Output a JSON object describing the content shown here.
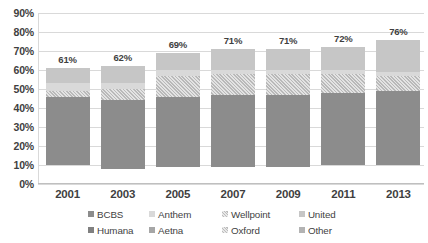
{
  "chart_data": {
    "type": "bar",
    "title": "",
    "xlabel": "",
    "ylabel": "",
    "stacked": true,
    "grid": true,
    "legend_position": "bottom",
    "ylim": [
      0,
      90
    ],
    "ytick_labels": [
      "90%",
      "80%",
      "70%",
      "60%",
      "50%",
      "40%",
      "30%",
      "20%",
      "10%",
      "0%"
    ],
    "ytick_values": [
      90,
      80,
      70,
      60,
      50,
      40,
      30,
      20,
      10,
      0
    ],
    "categories": [
      "2001",
      "2003",
      "2005",
      "2007",
      "2009",
      "2011",
      "2013"
    ],
    "totals": [
      61,
      62,
      69,
      71,
      71,
      72,
      76
    ],
    "total_labels": [
      "61%",
      "62%",
      "69%",
      "71%",
      "71%",
      "72%",
      "76%"
    ],
    "series": [
      {
        "name": "BCBS",
        "color": "#8c8c8c",
        "pattern": "solid",
        "values": [
          36,
          36,
          37,
          38,
          38,
          38,
          39
        ]
      },
      {
        "name": "Anthem",
        "color": "#d9d9d9",
        "pattern": "solid",
        "values": [
          4,
          3,
          3,
          2,
          2,
          2,
          2
        ]
      },
      {
        "name": "Wellpoint",
        "color": "#dcdcdc",
        "pattern": "diagonal-hatch",
        "values": [
          3,
          6,
          11,
          11,
          11,
          10,
          8
        ]
      },
      {
        "name": "United",
        "color": "#c6c6c6",
        "pattern": "solid",
        "values": [
          8,
          9,
          9,
          11,
          11,
          12,
          17
        ]
      },
      {
        "name": "Humana",
        "color": "#808080",
        "pattern": "solid",
        "values": [
          10,
          8,
          9,
          9,
          9,
          10,
          10
        ]
      },
      {
        "name": "Aetna",
        "color": "#a6a6a6",
        "pattern": "solid",
        "values": [
          0,
          0,
          0,
          0,
          0,
          0,
          0
        ]
      },
      {
        "name": "Oxford",
        "color": "#ededed",
        "pattern": "diagonal-hatch",
        "values": [
          0,
          0,
          0,
          0,
          0,
          0,
          0
        ]
      },
      {
        "name": "Other",
        "color": "#b3b3b3",
        "pattern": "solid",
        "values": [
          0,
          0,
          0,
          0,
          0,
          0,
          0
        ]
      }
    ],
    "legend": [
      {
        "label": "BCBS",
        "color": "#8c8c8c",
        "pattern": "solid"
      },
      {
        "label": "Anthem",
        "color": "#d9d9d9",
        "pattern": "solid"
      },
      {
        "label": "Wellpoint",
        "color": "#dcdcdc",
        "pattern": "diagonal-hatch"
      },
      {
        "label": "United",
        "color": "#c6c6c6",
        "pattern": "solid"
      },
      {
        "label": "Humana",
        "color": "#808080",
        "pattern": "solid"
      },
      {
        "label": "Aetna",
        "color": "#a6a6a6",
        "pattern": "solid"
      },
      {
        "label": "Oxford",
        "color": "#ededed",
        "pattern": "diagonal-hatch"
      },
      {
        "label": "Other",
        "color": "#b3b3b3",
        "pattern": "solid"
      }
    ]
  }
}
